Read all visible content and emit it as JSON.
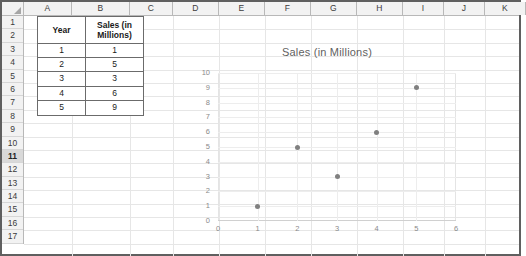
{
  "app": "spreadsheet",
  "sheet": {
    "column_headers": [
      "A",
      "B",
      "C",
      "D",
      "E",
      "F",
      "G",
      "H",
      "I",
      "J",
      "K"
    ],
    "row_headers": [
      "1",
      "2",
      "3",
      "4",
      "5",
      "6",
      "7",
      "8",
      "9",
      "10",
      "11",
      "12",
      "13",
      "14",
      "15",
      "16",
      "17"
    ],
    "selected_row": "11"
  },
  "table": {
    "headers": [
      "Year",
      "Sales (in Millions)"
    ],
    "header_a": "Year",
    "header_b_line1": "Sales (in",
    "header_b_line2": "Millions)",
    "rows": [
      {
        "year": "1",
        "sales": "1"
      },
      {
        "year": "2",
        "sales": "5"
      },
      {
        "year": "3",
        "sales": "3"
      },
      {
        "year": "4",
        "sales": "6"
      },
      {
        "year": "5",
        "sales": "9"
      }
    ]
  },
  "chart_data": {
    "type": "scatter",
    "title": "Sales (in Millions)",
    "xlabel": "",
    "ylabel": "",
    "x": [
      1,
      2,
      3,
      4,
      5
    ],
    "values": [
      1,
      5,
      3,
      6,
      9
    ],
    "points": [
      {
        "x": 1,
        "y": 1
      },
      {
        "x": 2,
        "y": 5
      },
      {
        "x": 3,
        "y": 3
      },
      {
        "x": 4,
        "y": 6
      },
      {
        "x": 5,
        "y": 9
      }
    ],
    "xlim": [
      0,
      6
    ],
    "ylim": [
      0,
      10
    ],
    "xticks": [
      "0",
      "1",
      "2",
      "3",
      "4",
      "5",
      "6"
    ],
    "yticks": [
      "10",
      "9",
      "8",
      "7",
      "6",
      "5",
      "4",
      "3",
      "2",
      "1",
      "0"
    ],
    "grid": true,
    "legend": false,
    "marker_color": "#808080",
    "title_color": "#5f5f5f",
    "tick_color": "#8a8a8a"
  }
}
